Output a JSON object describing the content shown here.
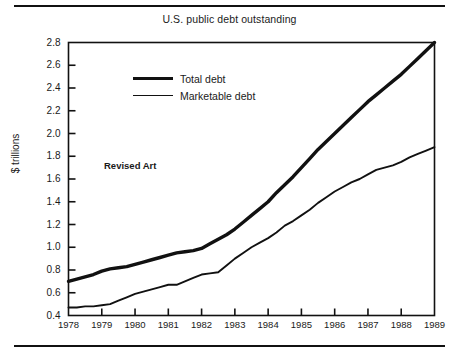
{
  "chart_data": {
    "type": "line",
    "title": "U.S. public debt outstanding",
    "xlabel": "",
    "ylabel": "$ trillions",
    "grid": false,
    "legend_position": "inside-upper-left",
    "annotation": "Revised Art",
    "xlim": [
      1978,
      1989
    ],
    "ylim": [
      0.4,
      2.8
    ],
    "ytick_labels": [
      "2.8",
      "2.6",
      "2.4",
      "2.2",
      "2.0",
      "1.8",
      "1.6",
      "1.4",
      "1.2",
      "1.0",
      "0.8",
      "0.6",
      "0.4"
    ],
    "ytick_values": [
      2.8,
      2.6,
      2.4,
      2.2,
      2.0,
      1.8,
      1.6,
      1.4,
      1.2,
      1.0,
      0.8,
      0.6,
      0.4
    ],
    "xtick_labels": [
      "1978",
      "1979",
      "1980",
      "1981",
      "1982",
      "1983",
      "1984",
      "1985",
      "1986",
      "1987",
      "1988",
      "1989"
    ],
    "xtick_values": [
      1978,
      1979,
      1980,
      1981,
      1982,
      1983,
      1984,
      1985,
      1986,
      1987,
      1988,
      1989
    ],
    "series": [
      {
        "name": "Total debt",
        "style": "thick",
        "x": [
          1978.0,
          1978.25,
          1978.5,
          1978.75,
          1979.0,
          1979.25,
          1979.5,
          1979.75,
          1980.0,
          1980.25,
          1980.5,
          1980.75,
          1981.0,
          1981.25,
          1981.5,
          1981.75,
          1982.0,
          1982.25,
          1982.5,
          1982.75,
          1983.0,
          1983.25,
          1983.5,
          1983.75,
          1984.0,
          1984.25,
          1984.5,
          1984.75,
          1985.0,
          1985.25,
          1985.5,
          1985.75,
          1986.0,
          1986.25,
          1986.5,
          1986.75,
          1987.0,
          1987.25,
          1987.5,
          1987.75,
          1988.0,
          1988.25,
          1988.5,
          1988.75,
          1989.0
        ],
        "values": [
          0.7,
          0.72,
          0.74,
          0.76,
          0.79,
          0.81,
          0.82,
          0.83,
          0.85,
          0.87,
          0.89,
          0.91,
          0.93,
          0.95,
          0.96,
          0.97,
          0.99,
          1.03,
          1.07,
          1.11,
          1.16,
          1.22,
          1.28,
          1.34,
          1.4,
          1.48,
          1.55,
          1.62,
          1.7,
          1.78,
          1.86,
          1.93,
          2.0,
          2.07,
          2.14,
          2.21,
          2.28,
          2.34,
          2.4,
          2.46,
          2.52,
          2.59,
          2.66,
          2.73,
          2.8
        ]
      },
      {
        "name": "Marketable debt",
        "style": "thin",
        "x": [
          1978.0,
          1978.25,
          1978.5,
          1978.75,
          1979.0,
          1979.25,
          1979.5,
          1979.75,
          1980.0,
          1980.25,
          1980.5,
          1980.75,
          1981.0,
          1981.25,
          1981.5,
          1981.75,
          1982.0,
          1982.25,
          1982.5,
          1982.75,
          1983.0,
          1983.25,
          1983.5,
          1983.75,
          1984.0,
          1984.25,
          1984.5,
          1984.75,
          1985.0,
          1985.25,
          1985.5,
          1985.75,
          1986.0,
          1986.25,
          1986.5,
          1986.75,
          1987.0,
          1987.25,
          1987.5,
          1987.75,
          1988.0,
          1988.25,
          1988.5,
          1988.75,
          1989.0
        ],
        "values": [
          0.47,
          0.47,
          0.48,
          0.48,
          0.49,
          0.5,
          0.53,
          0.56,
          0.59,
          0.61,
          0.63,
          0.65,
          0.67,
          0.67,
          0.7,
          0.73,
          0.76,
          0.77,
          0.78,
          0.84,
          0.9,
          0.95,
          1.0,
          1.04,
          1.08,
          1.13,
          1.19,
          1.23,
          1.28,
          1.33,
          1.39,
          1.44,
          1.49,
          1.53,
          1.57,
          1.6,
          1.64,
          1.68,
          1.7,
          1.72,
          1.75,
          1.79,
          1.82,
          1.85,
          1.88
        ]
      }
    ]
  },
  "colors": {
    "ink": "#111111",
    "background": "#ffffff"
  }
}
